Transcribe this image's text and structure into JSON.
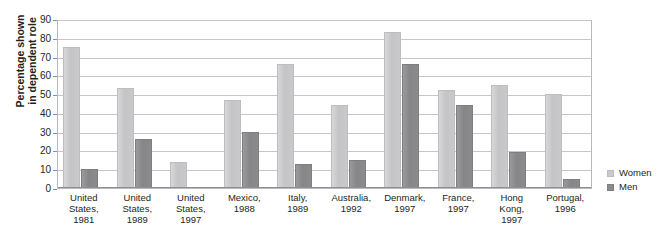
{
  "caption": {
    "fragment_left": "",
    "fragment_right": ""
  },
  "chart_data": {
    "type": "bar",
    "title": "",
    "xlabel": "",
    "ylabel": "Percentage shown in dependent role",
    "ylim": [
      0,
      90
    ],
    "ytick_step": 10,
    "yticks": [
      90,
      80,
      70,
      60,
      50,
      40,
      30,
      20,
      10,
      0
    ],
    "grid": true,
    "legend_position": "right",
    "categories": [
      "United States, 1981",
      "United States, 1989",
      "United States, 1997",
      "Mexico, 1988",
      "Italy, 1989",
      "Australia, 1992",
      "Denmark, 1997",
      "France, 1997",
      "Hong Kong, 1997",
      "Portugal, 1996"
    ],
    "category_lines": [
      [
        "United",
        "States,",
        "1981"
      ],
      [
        "United",
        "States,",
        "1989"
      ],
      [
        "United",
        "States,",
        "1997"
      ],
      [
        "Mexico,",
        "1988"
      ],
      [
        "Italy,",
        "1989"
      ],
      [
        "Australia,",
        "1992"
      ],
      [
        "Denmark,",
        "1997"
      ],
      [
        "France,",
        "1997"
      ],
      [
        "Hong",
        "Kong,",
        "1997"
      ],
      [
        "Portugal,",
        "1996"
      ]
    ],
    "series": [
      {
        "name": "Women",
        "color": "#c9c9cb",
        "values": [
          75,
          53,
          14,
          47,
          66,
          44,
          83,
          52,
          55,
          50
        ]
      },
      {
        "name": "Men",
        "color": "#8b8b8d",
        "values": [
          10,
          26,
          null,
          30,
          13,
          15,
          66,
          44,
          19,
          5
        ]
      }
    ]
  },
  "legend": {
    "items": [
      {
        "label": "Women",
        "swatch": "women-swatch"
      },
      {
        "label": "Men",
        "swatch": "men-swatch"
      }
    ]
  }
}
